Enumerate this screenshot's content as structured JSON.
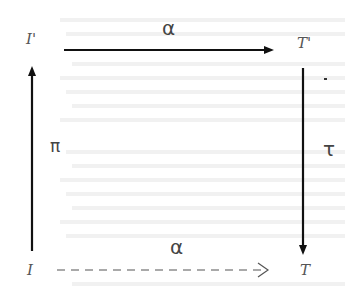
{
  "diagram": {
    "type": "commutative-square",
    "nodes": {
      "top_left": "I'",
      "top_right": "T'",
      "bottom_left": "I",
      "bottom_right": "T"
    },
    "edges": {
      "top": {
        "label": "α",
        "from": "I'",
        "to": "T'",
        "style": "solid"
      },
      "left": {
        "label": "π",
        "from": "I",
        "to": "I'",
        "style": "solid"
      },
      "right": {
        "label": "τ",
        "from": "T'",
        "to": "T",
        "style": "solid"
      },
      "bottom": {
        "label": "α",
        "from": "I",
        "to": "T",
        "style": "dashed"
      }
    },
    "colors": {
      "arrow": "#111111",
      "label": "#555555",
      "background": "#ffffff",
      "bleed_text": "#f1f1f1"
    }
  }
}
